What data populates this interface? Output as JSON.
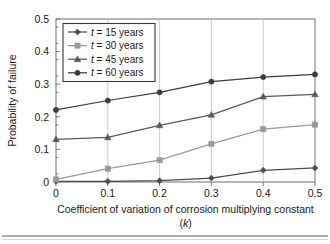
{
  "chart_data": {
    "type": "line",
    "title": "",
    "xlabel": "Coefficient of variation of corrosion multiplying constant",
    "xlabel_line2": "(k)",
    "xlabel_line2_italic_part": "k",
    "ylabel": "Probability of failure",
    "x": [
      0,
      0.1,
      0.2,
      0.3,
      0.4,
      0.5
    ],
    "xlim": [
      0,
      0.5
    ],
    "ylim": [
      0,
      0.5
    ],
    "xticks": [
      "0",
      "0.1",
      "0.2",
      "0.3",
      "0.4",
      "0.5"
    ],
    "yticks": [
      "0",
      "0.1",
      "0.2",
      "0.3",
      "0.4",
      "0.5"
    ],
    "grid": "vertical",
    "legend_position": "top-left-inside",
    "series": [
      {
        "name": "t = 15 years",
        "label_prefix_italic": "t",
        "label_rest": " = 15 years",
        "marker": "diamond",
        "color": "#4d4d4d",
        "values": [
          0.002,
          0.002,
          0.004,
          0.012,
          0.036,
          0.043
        ]
      },
      {
        "name": "t = 30 years",
        "label_prefix_italic": "t",
        "label_rest": " = 30 years",
        "marker": "square",
        "color": "#9a9a9a",
        "values": [
          0.008,
          0.041,
          0.067,
          0.117,
          0.162,
          0.176
        ]
      },
      {
        "name": "t = 45 years",
        "label_prefix_italic": "t",
        "label_rest": " = 45 years",
        "marker": "triangle",
        "color": "#5a5a5a",
        "values": [
          0.131,
          0.137,
          0.174,
          0.206,
          0.262,
          0.269
        ]
      },
      {
        "name": "t = 60 years",
        "label_prefix_italic": "t",
        "label_rest": " = 60 years",
        "marker": "circle",
        "color": "#3d3d3d",
        "values": [
          0.221,
          0.25,
          0.275,
          0.308,
          0.322,
          0.33
        ]
      }
    ]
  }
}
